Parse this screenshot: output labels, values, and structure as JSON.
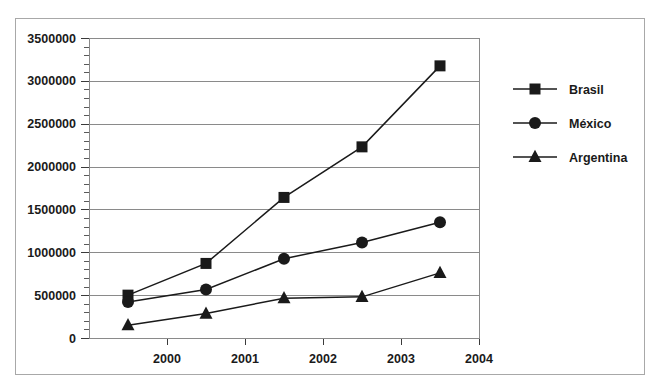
{
  "chart_data": {
    "type": "line",
    "title": "",
    "subtitle": "",
    "xlabel": "",
    "ylabel": "",
    "xlim": [
      1999,
      2004
    ],
    "ylim": [
      0,
      3500000
    ],
    "x": [
      1999.5,
      2000.5,
      2001.5,
      2002.5,
      2003.5
    ],
    "x_tick_labels": [
      "2000",
      "2001",
      "2002",
      "2003",
      "2004"
    ],
    "x_tick_values": [
      2000,
      2001,
      2002,
      2003,
      2004
    ],
    "y_tick_labels": [
      "0",
      "500000",
      "1000000",
      "1500000",
      "2000000",
      "2500000",
      "3000000",
      "3500000"
    ],
    "y_tick_values": [
      0,
      500000,
      1000000,
      1500000,
      2000000,
      2500000,
      3000000,
      3500000
    ],
    "y_minor_tick_step": 100000,
    "grid": true,
    "grid_axis": "y",
    "legend_position": "right",
    "series": [
      {
        "name": "Brasil",
        "marker": "square",
        "color": "#1a1a1a",
        "values": [
          500000,
          870000,
          1640000,
          2230000,
          3175000
        ]
      },
      {
        "name": "México",
        "marker": "circle",
        "color": "#1a1a1a",
        "values": [
          420000,
          565000,
          925000,
          1115000,
          1350000
        ]
      },
      {
        "name": "Argentina",
        "marker": "triangle",
        "color": "#1a1a1a",
        "values": [
          150000,
          285000,
          465000,
          480000,
          760000
        ]
      }
    ]
  },
  "legend": {
    "entries": [
      {
        "label": "Brasil",
        "marker": "square"
      },
      {
        "label": "México",
        "marker": "circle"
      },
      {
        "label": "Argentina",
        "marker": "triangle"
      }
    ]
  },
  "colors": {
    "series": "#1a1a1a",
    "gridline": "#8a8a8a",
    "frame": "#8a8a8a",
    "figure_border": "#a8a8a8",
    "background": "#ffffff",
    "text": "#1a1a1a"
  }
}
